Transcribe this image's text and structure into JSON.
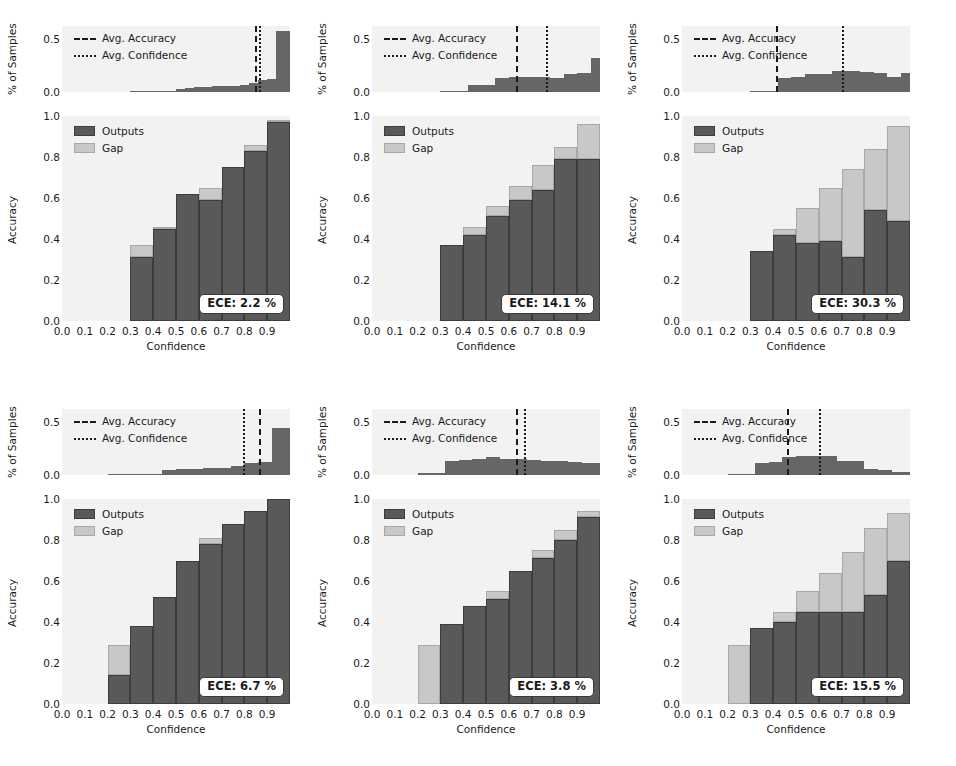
{
  "figure": {
    "width": 956,
    "height": 766,
    "background": "#ffffff",
    "colors": {
      "outputs": "#595959",
      "outputs_edge": "#3d3d3d",
      "gap": "#c8c8c8",
      "gap_edge": "#a8a8a8",
      "hist_bar": "#666666",
      "axes_background": "#f2f2f2",
      "line": "#1a1a1a"
    }
  },
  "common": {
    "hist_legend": [
      {
        "label": "Avg. Accuracy",
        "style": "dashed",
        "icon": "dashed-line-icon"
      },
      {
        "label": "Avg. Confidence",
        "style": "dotted",
        "icon": "dotted-line-icon"
      }
    ],
    "main_legend": [
      {
        "label": "Outputs",
        "swatch": "dark-gray-swatch-icon"
      },
      {
        "label": "Gap",
        "swatch": "light-gray-swatch-icon"
      }
    ],
    "hist_ylabel": "% of Samples",
    "hist_yticks": [
      "0.0",
      "0.5"
    ],
    "hist_ytick_values": [
      0.0,
      0.5
    ],
    "hist_ylim": [
      0.0,
      0.62
    ],
    "main_ylabel": "Accuracy",
    "main_yticks": [
      "0.0",
      "0.2",
      "0.4",
      "0.6",
      "0.8",
      "1.0"
    ],
    "main_ytick_values": [
      0.0,
      0.2,
      0.4,
      0.6,
      0.8,
      1.0
    ],
    "main_ylim": [
      0.0,
      1.0
    ],
    "xlabel": "Confidence",
    "xticks": [
      "0.0",
      "0.1",
      "0.2",
      "0.3",
      "0.4",
      "0.5",
      "0.6",
      "0.7",
      "0.8",
      "0.9"
    ],
    "xtick_values": [
      0.0,
      0.1,
      0.2,
      0.3,
      0.4,
      0.5,
      0.6,
      0.7,
      0.8,
      0.9
    ],
    "xlim": [
      0.0,
      1.0
    ]
  },
  "chart_data": {
    "type": "bar",
    "title": "",
    "panels": [
      {
        "id": "panel-1",
        "row": 0,
        "col": 0,
        "ece_label": "ECE: 2.2 %",
        "ece_value": 2.2,
        "avg_accuracy": 0.845,
        "avg_confidence": 0.862,
        "bin_edges": [
          0.0,
          0.1,
          0.2,
          0.3,
          0.4,
          0.5,
          0.6,
          0.7,
          0.8,
          0.9,
          1.0
        ],
        "accuracy": [
          0,
          0,
          0,
          0.31,
          0.45,
          0.62,
          0.59,
          0.75,
          0.83,
          0.97
        ],
        "gap_top": [
          0,
          0,
          0,
          0.37,
          0.46,
          0.62,
          0.65,
          0.75,
          0.86,
          0.98
        ],
        "hist": {
          "bin_edges": [
            0.3,
            0.34,
            0.38,
            0.42,
            0.46,
            0.5,
            0.54,
            0.58,
            0.62,
            0.66,
            0.7,
            0.74,
            0.78,
            0.82,
            0.86,
            0.9,
            0.94,
            1.0
          ],
          "values": [
            0.005,
            0.007,
            0.008,
            0.01,
            0.012,
            0.028,
            0.04,
            0.046,
            0.048,
            0.052,
            0.056,
            0.06,
            0.068,
            0.082,
            0.115,
            0.125,
            0.575
          ]
        }
      },
      {
        "id": "panel-2",
        "row": 0,
        "col": 1,
        "ece_label": "ECE: 14.1 %",
        "ece_value": 14.1,
        "avg_accuracy": 0.632,
        "avg_confidence": 0.762,
        "bin_edges": [
          0.0,
          0.1,
          0.2,
          0.3,
          0.4,
          0.5,
          0.6,
          0.7,
          0.8,
          0.9,
          1.0
        ],
        "accuracy": [
          0,
          0,
          0,
          0.37,
          0.42,
          0.51,
          0.59,
          0.64,
          0.79,
          0.79
        ],
        "gap_top": [
          0,
          0,
          0,
          0.37,
          0.46,
          0.56,
          0.66,
          0.76,
          0.85,
          0.96
        ],
        "hist": {
          "bin_edges": [
            0.3,
            0.36,
            0.42,
            0.48,
            0.54,
            0.6,
            0.66,
            0.72,
            0.78,
            0.84,
            0.9,
            0.96,
            1.0
          ],
          "values": [
            0.01,
            0.012,
            0.062,
            0.068,
            0.135,
            0.138,
            0.138,
            0.14,
            0.135,
            0.165,
            0.175,
            0.315
          ]
        }
      },
      {
        "id": "panel-3",
        "row": 0,
        "col": 2,
        "ece_label": "ECE: 30.3 %",
        "ece_value": 30.3,
        "avg_accuracy": 0.412,
        "avg_confidence": 0.7,
        "bin_edges": [
          0.0,
          0.1,
          0.2,
          0.3,
          0.4,
          0.5,
          0.6,
          0.7,
          0.8,
          0.9,
          1.0
        ],
        "accuracy": [
          0,
          0,
          0,
          0.34,
          0.42,
          0.38,
          0.39,
          0.31,
          0.54,
          0.49
        ],
        "gap_top": [
          0,
          0,
          0,
          0.34,
          0.45,
          0.55,
          0.65,
          0.74,
          0.84,
          0.95
        ],
        "hist": {
          "bin_edges": [
            0.3,
            0.36,
            0.42,
            0.48,
            0.54,
            0.6,
            0.66,
            0.72,
            0.78,
            0.84,
            0.9,
            0.96,
            1.0
          ],
          "values": [
            0.008,
            0.01,
            0.13,
            0.14,
            0.165,
            0.17,
            0.2,
            0.195,
            0.185,
            0.175,
            0.145,
            0.175
          ]
        }
      },
      {
        "id": "panel-4",
        "row": 1,
        "col": 0,
        "ece_label": "ECE: 6.7 %",
        "ece_value": 6.7,
        "avg_accuracy": 0.862,
        "avg_confidence": 0.795,
        "bin_edges": [
          0.0,
          0.1,
          0.2,
          0.3,
          0.4,
          0.5,
          0.6,
          0.7,
          0.8,
          0.9,
          1.0
        ],
        "accuracy": [
          0,
          0,
          0.14,
          0.38,
          0.52,
          0.7,
          0.78,
          0.88,
          0.94,
          1.0
        ],
        "gap_top": [
          0,
          0,
          0.29,
          0.38,
          0.52,
          0.7,
          0.81,
          0.88,
          0.94,
          1.0
        ],
        "hist": {
          "bin_edges": [
            0.2,
            0.26,
            0.32,
            0.38,
            0.44,
            0.5,
            0.56,
            0.62,
            0.68,
            0.74,
            0.8,
            0.86,
            0.92,
            1.0
          ],
          "values": [
            0.004,
            0.008,
            0.01,
            0.012,
            0.048,
            0.052,
            0.058,
            0.062,
            0.068,
            0.082,
            0.11,
            0.118,
            0.445
          ]
        }
      },
      {
        "id": "panel-5",
        "row": 1,
        "col": 1,
        "ece_label": "ECE: 3.8 %",
        "ece_value": 3.8,
        "avg_accuracy": 0.632,
        "avg_confidence": 0.668,
        "bin_edges": [
          0.0,
          0.1,
          0.2,
          0.3,
          0.4,
          0.5,
          0.6,
          0.7,
          0.8,
          0.9,
          1.0
        ],
        "accuracy": [
          0,
          0,
          0.0,
          0.39,
          0.48,
          0.51,
          0.65,
          0.71,
          0.8,
          0.91
        ],
        "gap_top": [
          0,
          0,
          0.29,
          0.39,
          0.48,
          0.55,
          0.65,
          0.75,
          0.85,
          0.94
        ],
        "hist": {
          "bin_edges": [
            0.2,
            0.26,
            0.32,
            0.38,
            0.44,
            0.5,
            0.56,
            0.62,
            0.68,
            0.74,
            0.8,
            0.86,
            0.92,
            1.0
          ],
          "values": [
            0.02,
            0.022,
            0.135,
            0.14,
            0.15,
            0.17,
            0.155,
            0.15,
            0.145,
            0.135,
            0.128,
            0.122,
            0.115
          ]
        }
      },
      {
        "id": "panel-6",
        "row": 1,
        "col": 2,
        "ece_label": "ECE: 15.5 %",
        "ece_value": 15.5,
        "avg_accuracy": 0.462,
        "avg_confidence": 0.6,
        "bin_edges": [
          0.0,
          0.1,
          0.2,
          0.3,
          0.4,
          0.5,
          0.6,
          0.7,
          0.8,
          0.9,
          1.0
        ],
        "accuracy": [
          0,
          0,
          0.0,
          0.37,
          0.4,
          0.45,
          0.45,
          0.45,
          0.53,
          0.7
        ],
        "gap_top": [
          0,
          0,
          0.29,
          0.37,
          0.45,
          0.55,
          0.64,
          0.74,
          0.86,
          0.93
        ],
        "hist": {
          "bin_edges": [
            0.2,
            0.26,
            0.32,
            0.38,
            0.44,
            0.5,
            0.56,
            0.62,
            0.68,
            0.74,
            0.8,
            0.86,
            0.92,
            1.0
          ],
          "values": [
            0.004,
            0.006,
            0.11,
            0.12,
            0.165,
            0.175,
            0.175,
            0.175,
            0.13,
            0.128,
            0.06,
            0.045,
            0.03
          ]
        }
      }
    ]
  }
}
